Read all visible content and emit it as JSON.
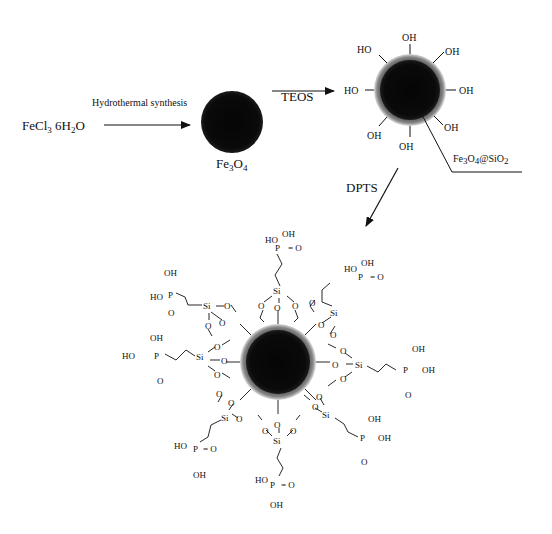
{
  "reactant": {
    "label": "FeCl",
    "sub1": "3",
    "rest": " 6H",
    "sub2": "2",
    "tail": "O"
  },
  "step1": {
    "reagent": "Hydrothermal synthesis"
  },
  "product1": {
    "label": "Fe",
    "sub1": "3",
    "mid": "O",
    "sub2": "4"
  },
  "step2": {
    "reagent": "TEOS"
  },
  "product2": {
    "label_parts": [
      "Fe",
      "3",
      "O",
      "4",
      "@SiO",
      "2"
    ],
    "surface_groups": [
      "OH",
      "OH",
      "OH",
      "OH",
      "OH",
      "OH",
      "HO",
      "HO"
    ]
  },
  "step3": {
    "reagent": "DPTS"
  },
  "product3": {
    "atoms": {
      "si": "Si",
      "o": "O",
      "p": "P",
      "oh": "OH",
      "ho": "HO",
      "double_o": "O"
    }
  }
}
